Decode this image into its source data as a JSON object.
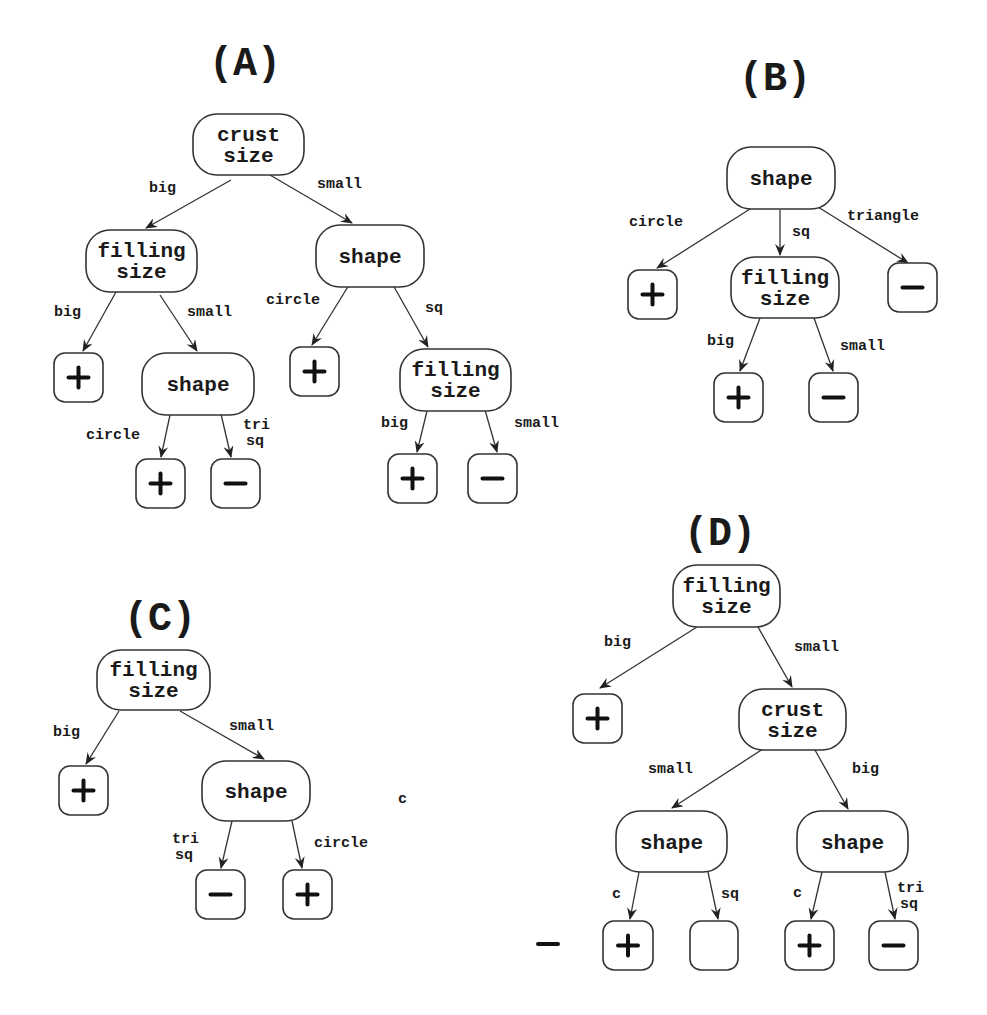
{
  "figure": {
    "panels": [
      {
        "id": "A",
        "title": "(A)",
        "title_pos": [
          245,
          75
        ],
        "nodes": [
          {
            "id": "a1",
            "type": "decision",
            "lines": [
              "crust",
              "size"
            ],
            "box": [
              193,
              114,
              111,
              61
            ]
          },
          {
            "id": "a2",
            "type": "decision",
            "lines": [
              "filling",
              "size"
            ],
            "box": [
              86,
              230,
              111,
              62
            ]
          },
          {
            "id": "a3",
            "type": "decision",
            "lines": [
              "shape"
            ],
            "box": [
              316,
              225,
              108,
              62
            ]
          },
          {
            "id": "a4",
            "type": "leaf",
            "value": "+",
            "box": [
              54,
              353,
              49,
              49
            ]
          },
          {
            "id": "a5",
            "type": "decision",
            "lines": [
              "shape"
            ],
            "box": [
              142,
              353,
              112,
              62
            ]
          },
          {
            "id": "a6",
            "type": "leaf",
            "value": "+",
            "box": [
              290,
              347,
              49,
              49
            ]
          },
          {
            "id": "a7",
            "type": "decision",
            "lines": [
              "filling",
              "size"
            ],
            "box": [
              400,
              349,
              111,
              62
            ]
          },
          {
            "id": "a8",
            "type": "leaf",
            "value": "+",
            "box": [
              136,
              459,
              49,
              49
            ]
          },
          {
            "id": "a9",
            "type": "leaf",
            "value": "-",
            "box": [
              211,
              459,
              49,
              49
            ]
          },
          {
            "id": "a10",
            "type": "leaf",
            "value": "+",
            "box": [
              388,
              454,
              49,
              49
            ]
          },
          {
            "id": "a11",
            "type": "leaf",
            "value": "-",
            "box": [
              468,
              454,
              49,
              49
            ]
          }
        ],
        "edges": [
          {
            "from": [
              231,
              180
            ],
            "to": [
              146,
              228
            ],
            "label": "big",
            "label_pos": [
              149,
              192
            ]
          },
          {
            "from": [
              270,
              175
            ],
            "to": [
              352,
              223
            ],
            "label": "small",
            "label_pos": [
              317,
              188
            ]
          },
          {
            "from": [
              116,
              292
            ],
            "to": [
              83,
              351
            ],
            "label": "big",
            "label_pos": [
              54,
              316
            ]
          },
          {
            "from": [
              160,
              295
            ],
            "to": [
              197,
              351
            ],
            "label": "small",
            "label_pos": [
              187,
              316
            ]
          },
          {
            "from": [
              349,
              285
            ],
            "to": [
              312,
              345
            ],
            "label": "circle",
            "label_pos": [
              266,
              304
            ]
          },
          {
            "from": [
              393,
              285
            ],
            "to": [
              428,
              347
            ],
            "label": "sq",
            "label_pos": [
              425,
              312
            ]
          },
          {
            "from": [
              170,
              415
            ],
            "to": [
              161,
              457
            ],
            "label": "circle",
            "label_pos": [
              86,
              439
            ]
          },
          {
            "from": [
              221,
              414
            ],
            "to": [
              231,
              457
            ],
            "label": "tri\nsq",
            "label_pos": [
              243,
              429
            ]
          },
          {
            "from": [
              427,
              411
            ],
            "to": [
              417,
              452
            ],
            "label": "big",
            "label_pos": [
              381,
              427
            ]
          },
          {
            "from": [
              485,
              410
            ],
            "to": [
              497,
              452
            ],
            "label": "small",
            "label_pos": [
              514,
              427
            ]
          }
        ]
      },
      {
        "id": "B",
        "title": "(B)",
        "title_pos": [
          775,
          90
        ],
        "nodes": [
          {
            "id": "b1",
            "type": "decision",
            "lines": [
              "shape"
            ],
            "box": [
              727,
              147,
              108,
              62
            ]
          },
          {
            "id": "b2",
            "type": "leaf",
            "value": "+",
            "box": [
              628,
              270,
              49,
              49
            ]
          },
          {
            "id": "b3",
            "type": "decision",
            "lines": [
              "filling",
              "size"
            ],
            "box": [
              731,
              257,
              108,
              61
            ]
          },
          {
            "id": "b4",
            "type": "leaf",
            "value": "-",
            "box": [
              888,
              263,
              49,
              49
            ]
          },
          {
            "id": "b5",
            "type": "leaf",
            "value": "+",
            "box": [
              714,
              373,
              49,
              49
            ]
          },
          {
            "id": "b6",
            "type": "leaf",
            "value": "-",
            "box": [
              809,
              373,
              49,
              49
            ]
          }
        ],
        "edges": [
          {
            "from": [
              750,
              209
            ],
            "to": [
              657,
              268
            ],
            "label": "circle",
            "label_pos": [
              629,
              226
            ]
          },
          {
            "from": [
              780,
              210
            ],
            "to": [
              780,
              255
            ],
            "label": "sq",
            "label_pos": [
              792,
              236
            ]
          },
          {
            "from": [
              818,
              207
            ],
            "to": [
              908,
              263
            ],
            "label": "triangle",
            "label_pos": [
              847,
              220
            ]
          },
          {
            "from": [
              760,
              318
            ],
            "to": [
              740,
              371
            ],
            "label": "big",
            "label_pos": [
              707,
              345
            ]
          },
          {
            "from": [
              814,
              318
            ],
            "to": [
              833,
              371
            ],
            "label": "small",
            "label_pos": [
              840,
              350
            ]
          }
        ]
      },
      {
        "id": "C",
        "title": "(C)",
        "title_pos": [
          160,
          630
        ],
        "nodes": [
          {
            "id": "c1",
            "type": "decision",
            "lines": [
              "filling",
              "size"
            ],
            "box": [
              97,
              650,
              113,
              60
            ]
          },
          {
            "id": "c2",
            "type": "leaf",
            "value": "+",
            "box": [
              59,
              766,
              49,
              49
            ]
          },
          {
            "id": "c3",
            "type": "decision",
            "lines": [
              "shape"
            ],
            "box": [
              202,
              761,
              108,
              60
            ]
          },
          {
            "id": "c4",
            "type": "leaf",
            "value": "-",
            "box": [
              196,
              870,
              49,
              49
            ]
          },
          {
            "id": "c5",
            "type": "leaf",
            "value": "+",
            "box": [
              283,
              870,
              49,
              49
            ]
          }
        ],
        "edges": [
          {
            "from": [
              119,
              711
            ],
            "to": [
              86,
              764
            ],
            "label": "big",
            "label_pos": [
              53,
              736
            ]
          },
          {
            "from": [
              180,
              711
            ],
            "to": [
              264,
              759
            ],
            "label": "small",
            "label_pos": [
              229,
              730
            ]
          },
          {
            "from": [
              232,
              821
            ],
            "to": [
              221,
              868
            ],
            "label": "tri\nsq",
            "label_pos": [
              172,
              843
            ]
          },
          {
            "from": [
              292,
              821
            ],
            "to": [
              302,
              868
            ],
            "label": "circle",
            "label_pos": [
              314,
              847
            ]
          }
        ],
        "stray_text": [
          {
            "text": "c",
            "pos": [
              398,
              803
            ]
          }
        ]
      },
      {
        "id": "D",
        "title": "(D)",
        "title_pos": [
          720,
          545
        ],
        "nodes": [
          {
            "id": "d1",
            "type": "decision",
            "lines": [
              "filling",
              "size"
            ],
            "box": [
              673,
              565,
              107,
              62
            ]
          },
          {
            "id": "d2",
            "type": "leaf",
            "value": "+",
            "box": [
              573,
              694,
              49,
              49
            ]
          },
          {
            "id": "d3",
            "type": "decision",
            "lines": [
              "crust",
              "size"
            ],
            "box": [
              739,
              689,
              107,
              61
            ]
          },
          {
            "id": "d4",
            "type": "decision",
            "lines": [
              "shape"
            ],
            "box": [
              616,
              811,
              111,
              61
            ]
          },
          {
            "id": "d5",
            "type": "decision",
            "lines": [
              "shape"
            ],
            "box": [
              797,
              811,
              111,
              61
            ]
          },
          {
            "id": "d6",
            "type": "leaf",
            "value": "+",
            "box": [
              603,
              921,
              50,
              49
            ]
          },
          {
            "id": "d7",
            "type": "leaf",
            "value": "",
            "box": [
              690,
              921,
              48,
              49
            ]
          },
          {
            "id": "d8",
            "type": "leaf",
            "value": "+",
            "box": [
              785,
              921,
              49,
              49
            ]
          },
          {
            "id": "d9",
            "type": "leaf",
            "value": "-",
            "box": [
              869,
              921,
              49,
              49
            ]
          }
        ],
        "edges": [
          {
            "from": [
              697,
              627
            ],
            "to": [
              600,
              688
            ],
            "label": "big",
            "label_pos": [
              604,
              646
            ]
          },
          {
            "from": [
              758,
              627
            ],
            "to": [
              792,
              687
            ],
            "label": "small",
            "label_pos": [
              794,
              651
            ]
          },
          {
            "from": [
              766,
              747
            ],
            "to": [
              672,
              808
            ],
            "label": "small",
            "label_pos": [
              648,
              773
            ]
          },
          {
            "from": [
              815,
              750
            ],
            "to": [
              848,
              809
            ],
            "label": "big",
            "label_pos": [
              852,
              773
            ]
          },
          {
            "from": [
              639,
              872
            ],
            "to": [
              630,
              919
            ],
            "label": "c",
            "label_pos": [
              612,
              898
            ]
          },
          {
            "from": [
              708,
              872
            ],
            "to": [
              718,
              919
            ],
            "label": "sq",
            "label_pos": [
              721,
              898
            ]
          },
          {
            "from": [
              822,
              872
            ],
            "to": [
              811,
              919
            ],
            "label": "c",
            "label_pos": [
              793,
              897
            ]
          },
          {
            "from": [
              885,
              872
            ],
            "to": [
              895,
              919
            ],
            "label": "tri\nsq",
            "label_pos": [
              897,
              892
            ]
          }
        ],
        "stray_glyphs": [
          {
            "value": "-",
            "pos": [
              548,
              944
            ]
          }
        ]
      }
    ]
  },
  "colors": {
    "background": "#ffffff",
    "stroke": "#333333",
    "text": "#1a1a1a"
  }
}
